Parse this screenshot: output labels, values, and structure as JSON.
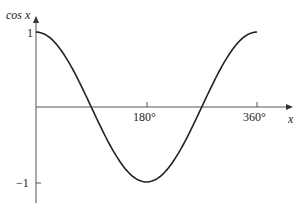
{
  "chart_data": {
    "type": "line",
    "title": "",
    "function": "cos x",
    "xlabel": "x",
    "ylabel": "cos x",
    "x_ticks": [
      "180°",
      "360°"
    ],
    "y_ticks": [
      "1",
      "−1"
    ],
    "xlim": [
      0,
      360
    ],
    "ylim": [
      -1,
      1
    ],
    "grid": false,
    "series": [
      {
        "name": "cos x",
        "x": [
          0,
          45,
          90,
          135,
          180,
          225,
          270,
          315,
          360
        ],
        "y": [
          1,
          0.707,
          0,
          -0.707,
          -1,
          -0.707,
          0,
          0.707,
          1
        ]
      }
    ]
  },
  "labels": {
    "y_axis": "cos x",
    "x_axis": "x",
    "y_one": "1",
    "y_neg_one": "−1",
    "x_180": "180°",
    "x_360": "360°"
  }
}
